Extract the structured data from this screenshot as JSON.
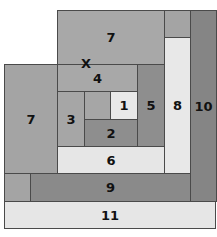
{
  "diagram": {
    "type": "nested-rectangles",
    "colors": {
      "mid_gray": "#a8a8a8",
      "dark_gray": "#8c8c8c",
      "darker_gray": "#858585",
      "light_gray": "#e6e6e6",
      "border": "#4a4a4a"
    },
    "marker": "X",
    "rects": [
      {
        "label": "7",
        "x": 57,
        "y": 10,
        "w": 108,
        "h": 55,
        "color": "#a8a8a8"
      },
      {
        "label": "",
        "x": 164,
        "y": 10,
        "w": 27,
        "h": 28,
        "color": "#a4a4a4"
      },
      {
        "label": "8",
        "x": 164,
        "y": 37,
        "w": 27,
        "h": 137,
        "color": "#e8e8e8"
      },
      {
        "label": "10",
        "x": 190,
        "y": 10,
        "w": 27,
        "h": 192,
        "color": "#858585"
      },
      {
        "label": "7",
        "x": 4,
        "y": 64,
        "w": 54,
        "h": 110,
        "color": "#a4a4a4"
      },
      {
        "label": "4",
        "x": 57,
        "y": 64,
        "w": 81,
        "h": 28,
        "color": "#a8a8a8"
      },
      {
        "label": "5",
        "x": 137,
        "y": 64,
        "w": 28,
        "h": 83,
        "color": "#8e8e8e"
      },
      {
        "label": "3",
        "x": 57,
        "y": 91,
        "w": 28,
        "h": 56,
        "color": "#a6a6a6"
      },
      {
        "label": "",
        "x": 84,
        "y": 91,
        "w": 27,
        "h": 29,
        "color": "#a6a6a6"
      },
      {
        "label": "1",
        "x": 110,
        "y": 91,
        "w": 28,
        "h": 29,
        "color": "#e8e8e8"
      },
      {
        "label": "2",
        "x": 84,
        "y": 119,
        "w": 54,
        "h": 28,
        "color": "#8e8e8e"
      },
      {
        "label": "6",
        "x": 57,
        "y": 146,
        "w": 108,
        "h": 28,
        "color": "#e6e6e6"
      },
      {
        "label": "",
        "x": 4,
        "y": 173,
        "w": 27,
        "h": 29,
        "color": "#a4a4a4"
      },
      {
        "label": "9",
        "x": 30,
        "y": 173,
        "w": 161,
        "h": 29,
        "color": "#8a8a8a"
      },
      {
        "label": "11",
        "x": 4,
        "y": 201,
        "w": 212,
        "h": 28,
        "color": "#e6e6e6"
      }
    ]
  }
}
